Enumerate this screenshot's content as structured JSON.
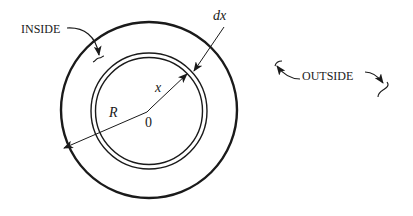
{
  "diagram": {
    "type": "concentric-circles",
    "colors": {
      "stroke": "#1a1a1a",
      "background": "#ffffff"
    },
    "labels": {
      "inside": "INSIDE",
      "outside": "OUTSIDE",
      "dx": "dx",
      "x": "x",
      "R": "R",
      "origin": "0"
    },
    "shapes": {
      "outer_circle": {
        "cx": 149,
        "cy": 110,
        "r": 88
      },
      "shell_outer_circle": {
        "cx": 149,
        "cy": 111,
        "r": 58
      },
      "shell_inner_circle": {
        "cx": 149,
        "cy": 111,
        "r": 53.5
      }
    },
    "arrows": [
      {
        "name": "radius-R",
        "from": "origin",
        "to": "outer-circle",
        "label": "R"
      },
      {
        "name": "radius-x",
        "from": "origin",
        "to": "shell",
        "label": "x"
      },
      {
        "name": "thickness-dx",
        "from": "label dx",
        "to": "shell",
        "label": "dx"
      },
      {
        "name": "inside-pointer",
        "label": "INSIDE"
      },
      {
        "name": "outside-pointers",
        "label": "OUTSIDE"
      }
    ]
  }
}
